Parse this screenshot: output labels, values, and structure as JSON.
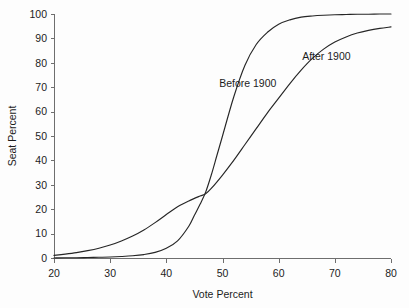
{
  "chart_data": {
    "type": "line",
    "title": "",
    "subtitle": "",
    "xlabel": "Vote Percent",
    "ylabel": "Seat Percent",
    "xlim": [
      20,
      80
    ],
    "ylim": [
      0,
      100
    ],
    "xticks": [
      20,
      30,
      40,
      50,
      60,
      70,
      80
    ],
    "yticks": [
      0,
      10,
      20,
      30,
      40,
      50,
      60,
      70,
      80,
      90,
      100
    ],
    "xtick_labels": [
      "20",
      "30",
      "40",
      "50",
      "60",
      "70",
      "80"
    ],
    "ytick_labels": [
      "0",
      "10",
      "20",
      "30",
      "40",
      "50",
      "60",
      "70",
      "80",
      "90",
      "100"
    ],
    "grid": false,
    "legend_position": "inline-annotation",
    "annotations": [
      {
        "text": "Before 1900",
        "x": 54.5,
        "y": 70
      },
      {
        "text": "After 1900",
        "x": 68.5,
        "y": 81
      }
    ],
    "series": [
      {
        "name": "Before 1900",
        "color": "#262626",
        "x": [
          20,
          22,
          24,
          26,
          28,
          30,
          32,
          34,
          36,
          38,
          40,
          42,
          44,
          45,
          46,
          47,
          48,
          49,
          50,
          52,
          54,
          56,
          58,
          60,
          62,
          64,
          66,
          68,
          70,
          72,
          74,
          76,
          78,
          80
        ],
        "y": [
          0.0,
          0.1,
          0.1,
          0.2,
          0.3,
          0.4,
          0.6,
          0.9,
          1.4,
          2.3,
          4.0,
          7.0,
          13.0,
          17.5,
          22.0,
          27.0,
          34.0,
          42.0,
          50.0,
          66.0,
          79.0,
          87.5,
          92.5,
          95.8,
          97.6,
          98.7,
          99.2,
          99.5,
          99.7,
          99.8,
          99.9,
          99.9,
          100.0,
          100.0
        ]
      },
      {
        "name": "After 1900",
        "color": "#262626",
        "x": [
          20,
          22,
          24,
          26,
          28,
          30,
          32,
          34,
          36,
          38,
          40,
          42,
          44,
          46,
          47,
          48,
          50,
          52,
          54,
          56,
          58,
          60,
          62,
          64,
          66,
          68,
          70,
          72,
          74,
          76,
          78,
          80
        ],
        "y": [
          1.1,
          1.6,
          2.2,
          3.0,
          4.0,
          5.3,
          7.0,
          9.0,
          11.5,
          14.5,
          17.8,
          21.0,
          23.4,
          25.4,
          26.3,
          28.5,
          34.0,
          40.0,
          46.5,
          53.0,
          59.5,
          65.5,
          71.5,
          77.0,
          81.8,
          85.6,
          88.5,
          90.6,
          92.2,
          93.3,
          94.1,
          94.7
        ]
      }
    ]
  },
  "axes": {
    "x": {
      "title": "Vote Percent"
    },
    "y": {
      "title": "Seat Percent"
    }
  },
  "layout": {
    "plot_left_px": 54,
    "plot_right_px": 391,
    "plot_top_px": 14,
    "plot_bottom_px": 258
  },
  "colors": {
    "curve": "#262626",
    "axis": "#6e6e6e",
    "text": "#1c1c1c",
    "background": "#fdfdfd"
  }
}
